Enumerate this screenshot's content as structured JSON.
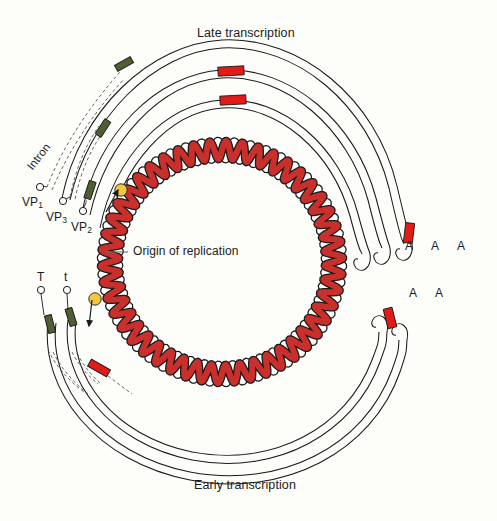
{
  "figure": {
    "title_top": "Late transcription",
    "title_bottom": "Early transcription",
    "origin_label": "Origin of replication",
    "intron_label": "Intron"
  },
  "late_transcripts": [
    {
      "id": "vp1",
      "name_base": "VP",
      "name_sub": "1",
      "cap": "open-circle",
      "has_green_block": true,
      "has_red_block": false,
      "polyA": "A"
    },
    {
      "id": "vp3",
      "name_base": "VP",
      "name_sub": "3",
      "cap": "open-circle",
      "has_green_block": true,
      "has_red_block": true,
      "polyA": "A"
    },
    {
      "id": "vp2",
      "name_base": "VP",
      "name_sub": "2",
      "cap": "open-circle",
      "has_green_block": true,
      "has_red_block": true,
      "polyA": "A"
    }
  ],
  "early_transcripts": [
    {
      "id": "T",
      "name_base": "T",
      "name_sub": "",
      "cap": "open-circle",
      "has_green_block": true,
      "has_red_block": false,
      "polyA": "A"
    },
    {
      "id": "t",
      "name_base": "t",
      "name_sub": "",
      "cap": "open-circle",
      "has_green_block": true,
      "has_red_block": true,
      "polyA": "A"
    }
  ],
  "polyA_late": [
    "A",
    "A",
    "A"
  ],
  "polyA_early": [
    "A",
    "A"
  ],
  "colors": {
    "background": "#fdfdfa",
    "dna_strand_red": "#c9302c",
    "dna_strand_white": "#ffffff",
    "outline": "#1a1a1a",
    "exon_red": "#e01b18",
    "leader_green": "#4f5f33",
    "origin_yellow": "#f2c640",
    "text": "#1b1b1b"
  },
  "geometry": {
    "center_x": 222,
    "center_y": 262,
    "dna_radius": 112,
    "arc_radii": [
      148,
      168,
      188
    ],
    "turns": 46
  }
}
